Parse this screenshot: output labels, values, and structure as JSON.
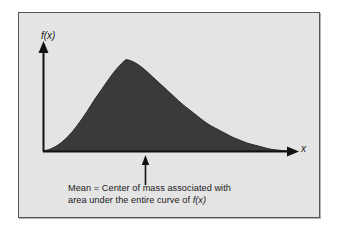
{
  "figure": {
    "type": "probability-density-illustration",
    "panel_background": "#e4e4e4",
    "page_background": "#ffffff",
    "border_color": "#56565a",
    "axes": {
      "y_label": "f(x)",
      "x_label": "x",
      "axis_color": "#111111"
    },
    "caption": {
      "line1": "Mean = Center of mass associated with",
      "line2_prefix": "area under the entire curve of ",
      "line2_math": "f(x)"
    },
    "annotation": {
      "name": "mean-indicator-arrow",
      "points_to": "x-axis location of the mean",
      "direction": "up"
    }
  },
  "chart_data": {
    "type": "area",
    "title": "",
    "subtitle": "",
    "xlabel": "x",
    "ylabel": "f(x)",
    "grid": false,
    "legend": null,
    "curve_fill_color": "#3a3a3a",
    "curve_line_color": "#2a2a2a",
    "axis_color": "#111111",
    "xlim": [
      0,
      100
    ],
    "ylim": [
      0,
      100
    ],
    "peak_x": 34,
    "mean_x": 42,
    "points": [
      {
        "x": 0,
        "y": 0
      },
      {
        "x": 3,
        "y": 2
      },
      {
        "x": 6,
        "y": 6
      },
      {
        "x": 9,
        "y": 12
      },
      {
        "x": 12,
        "y": 20
      },
      {
        "x": 15,
        "y": 30
      },
      {
        "x": 18,
        "y": 41
      },
      {
        "x": 21,
        "y": 53
      },
      {
        "x": 24,
        "y": 64
      },
      {
        "x": 27,
        "y": 75
      },
      {
        "x": 30,
        "y": 85
      },
      {
        "x": 33,
        "y": 93
      },
      {
        "x": 34,
        "y": 95
      },
      {
        "x": 36,
        "y": 94
      },
      {
        "x": 39,
        "y": 90
      },
      {
        "x": 42,
        "y": 84
      },
      {
        "x": 45,
        "y": 77
      },
      {
        "x": 48,
        "y": 70
      },
      {
        "x": 51,
        "y": 63
      },
      {
        "x": 54,
        "y": 56
      },
      {
        "x": 57,
        "y": 49
      },
      {
        "x": 60,
        "y": 43
      },
      {
        "x": 63,
        "y": 37
      },
      {
        "x": 66,
        "y": 31
      },
      {
        "x": 69,
        "y": 26
      },
      {
        "x": 72,
        "y": 22
      },
      {
        "x": 75,
        "y": 18
      },
      {
        "x": 78,
        "y": 14
      },
      {
        "x": 81,
        "y": 11
      },
      {
        "x": 84,
        "y": 8
      },
      {
        "x": 87,
        "y": 6
      },
      {
        "x": 90,
        "y": 4
      },
      {
        "x": 93,
        "y": 2
      },
      {
        "x": 96,
        "y": 1
      },
      {
        "x": 100,
        "y": 0
      }
    ]
  }
}
